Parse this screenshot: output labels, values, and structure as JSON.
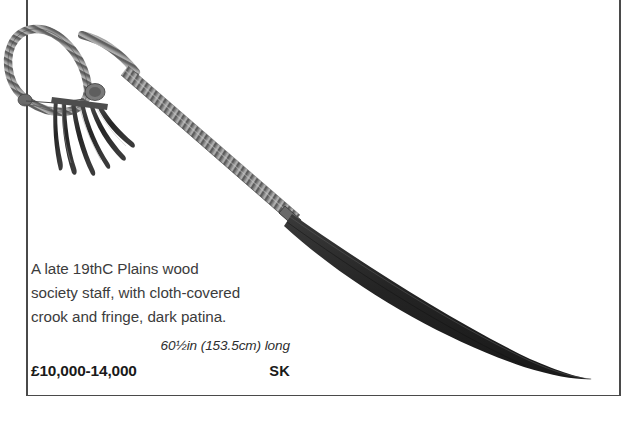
{
  "entry": {
    "description_lines": [
      "A late 19thC Plains wood",
      "society staff, with cloth-covered",
      "crook and fringe, dark patina."
    ],
    "dimensions": "60½in (153.5cm) long",
    "estimate": "£10,000-14,000",
    "initials": "SK"
  },
  "photo": {
    "object_name": "plains-society-staff",
    "parts": {
      "crook_loop": "cloth-covered crook loop",
      "fringe": "leather fringe",
      "wrapped_shaft": "cloth-wrapped shaft",
      "bare_shaft": "dark patina wood shaft"
    }
  },
  "colors": {
    "rule": "#4a4a4a",
    "body_text": "#3c3c3c",
    "bold_text": "#1a1a1a",
    "wrap_light": "#bdbdbd",
    "wrap_mid": "#8d8d8d",
    "wrap_dark": "#5a5a5a",
    "wood_dark": "#2b2b2b",
    "wood_mid": "#4f4f4f",
    "background": "#ffffff"
  }
}
